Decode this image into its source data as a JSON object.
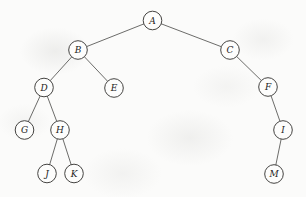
{
  "diagram": {
    "type": "binary-tree",
    "canvas": {
      "width": 306,
      "height": 197,
      "background": "#fbfbfa"
    },
    "style": {
      "node_radius": 9.3,
      "node_fill": "#fdfdfc",
      "node_stroke": "#3b3a38",
      "edge_stroke": "#52514f",
      "label_color": "#242322"
    },
    "nodes": [
      {
        "id": "A",
        "label": "A",
        "x": 152.5,
        "y": 20.5
      },
      {
        "id": "B",
        "label": "B",
        "x": 78.0,
        "y": 50.0
      },
      {
        "id": "C",
        "label": "C",
        "x": 230.0,
        "y": 50.0
      },
      {
        "id": "D",
        "label": "D",
        "x": 44.0,
        "y": 87.5
      },
      {
        "id": "E",
        "label": "E",
        "x": 114.0,
        "y": 88.0
      },
      {
        "id": "F",
        "label": "F",
        "x": 268.0,
        "y": 87.0
      },
      {
        "id": "G",
        "label": "G",
        "x": 24.5,
        "y": 130.0
      },
      {
        "id": "H",
        "label": "H",
        "x": 60.0,
        "y": 130.0
      },
      {
        "id": "I",
        "label": "I",
        "x": 283.0,
        "y": 130.0
      },
      {
        "id": "J",
        "label": "J",
        "x": 47.0,
        "y": 173.5
      },
      {
        "id": "K",
        "label": "K",
        "x": 74.0,
        "y": 173.5
      },
      {
        "id": "M",
        "label": "M",
        "x": 274.0,
        "y": 174.0
      }
    ],
    "edges": [
      {
        "from": "A",
        "to": "B",
        "side": "left"
      },
      {
        "from": "A",
        "to": "C",
        "side": "right"
      },
      {
        "from": "B",
        "to": "D",
        "side": "left"
      },
      {
        "from": "B",
        "to": "E",
        "side": "right"
      },
      {
        "from": "C",
        "to": "F",
        "side": "right"
      },
      {
        "from": "D",
        "to": "G",
        "side": "left"
      },
      {
        "from": "D",
        "to": "H",
        "side": "right"
      },
      {
        "from": "F",
        "to": "I",
        "side": "right"
      },
      {
        "from": "H",
        "to": "J",
        "side": "left"
      },
      {
        "from": "H",
        "to": "K",
        "side": "right"
      },
      {
        "from": "I",
        "to": "M",
        "side": "left"
      }
    ]
  }
}
